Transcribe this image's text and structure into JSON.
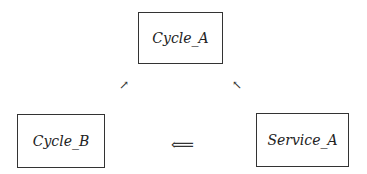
{
  "diagram": {
    "nodes": [
      {
        "id": "cycle_a",
        "label": "Cycle_A"
      },
      {
        "id": "cycle_b",
        "label": "Cycle_B"
      },
      {
        "id": "service_a",
        "label": "Service_A"
      }
    ],
    "edges": [
      {
        "from": "cycle_b",
        "to": "cycle_a",
        "glyph": "↗"
      },
      {
        "from": "service_a",
        "to": "cycle_a",
        "glyph": "↖"
      },
      {
        "from": "service_a",
        "to": "cycle_b",
        "glyph": "⟸"
      }
    ]
  }
}
